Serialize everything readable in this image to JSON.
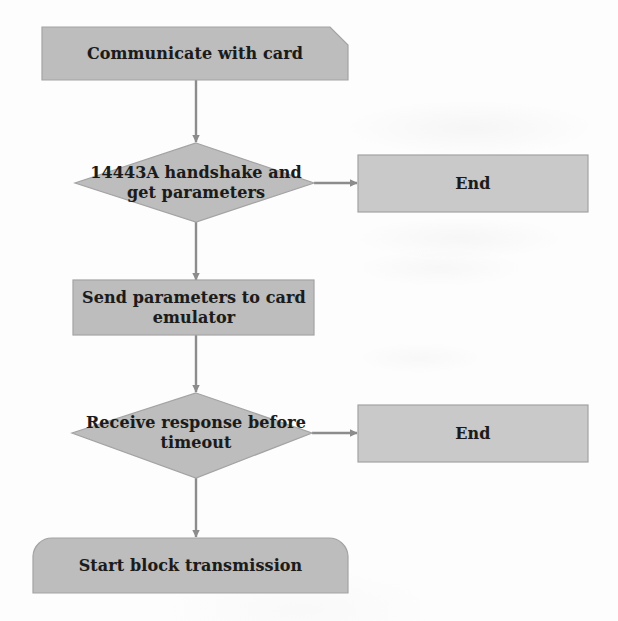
{
  "diagram": {
    "type": "flowchart",
    "palette": {
      "background": "#fdfdfd",
      "node_fill": "#bdbdbd",
      "node_fill_light": "#c9c9c9",
      "node_stroke": "#9a9a9a",
      "connector": "#8c8c8c",
      "text": "#1b1b1b"
    },
    "nodes": [
      {
        "id": "start",
        "shape": "chamfered-rectangle",
        "label": "Communicate with card"
      },
      {
        "id": "decision-handshake",
        "shape": "diamond",
        "label": "14443A handshake and get parameters"
      },
      {
        "id": "end-handshake",
        "shape": "rectangle",
        "label": "End"
      },
      {
        "id": "send-parameters",
        "shape": "rectangle",
        "label": "Send parameters to card emulator"
      },
      {
        "id": "decision-timeout",
        "shape": "diamond",
        "label": "Receive response before timeout"
      },
      {
        "id": "end-timeout",
        "shape": "rectangle",
        "label": "End"
      },
      {
        "id": "start-block-transmission",
        "shape": "rounded-top-rectangle",
        "label": "Start block transmission"
      }
    ],
    "connectors": [
      {
        "id": "start-to-decision1",
        "from": "start",
        "to": "decision-handshake",
        "direction": "down",
        "label": ""
      },
      {
        "id": "decision1-to-end1",
        "from": "decision-handshake",
        "to": "end-handshake",
        "direction": "right",
        "label": ""
      },
      {
        "id": "decision1-to-send",
        "from": "decision-handshake",
        "to": "send-parameters",
        "direction": "down",
        "label": ""
      },
      {
        "id": "send-to-decision2",
        "from": "send-parameters",
        "to": "decision-timeout",
        "direction": "down",
        "label": ""
      },
      {
        "id": "decision2-to-end2",
        "from": "decision-timeout",
        "to": "end-timeout",
        "direction": "right",
        "label": ""
      },
      {
        "id": "decision2-to-finish",
        "from": "decision-timeout",
        "to": "start-block-transmission",
        "direction": "down",
        "label": ""
      }
    ]
  }
}
